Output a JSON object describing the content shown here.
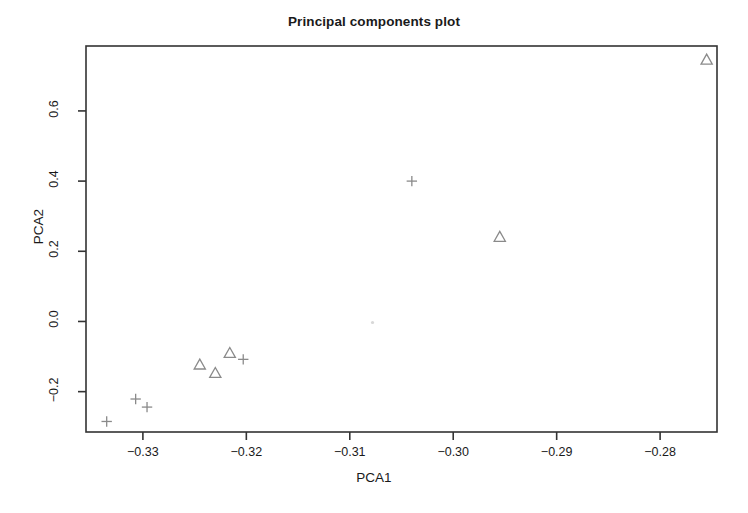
{
  "chart_data": {
    "type": "scatter",
    "title": "Principal components plot",
    "xlabel": "PCA1",
    "ylabel": "PCA2",
    "xlim": [
      -0.3355,
      -0.2745
    ],
    "ylim": [
      -0.315,
      0.785
    ],
    "grid": false,
    "legend": null,
    "xticks": [
      -0.33,
      -0.32,
      -0.31,
      -0.3,
      -0.29,
      -0.28
    ],
    "xtick_labels": [
      "−0.33",
      "−0.32",
      "−0.31",
      "−0.30",
      "−0.29",
      "−0.28"
    ],
    "yticks": [
      -0.2,
      0.0,
      0.2,
      0.4,
      0.6
    ],
    "ytick_labels": [
      "−0.2",
      "0.0",
      "0.2",
      "0.4",
      "0.6"
    ],
    "marker_color": "#8a8a8a",
    "frame_color": "#333333",
    "series": [
      {
        "name": "plus-group",
        "marker": "plus",
        "points": [
          {
            "x": -0.3335,
            "y": -0.285
          },
          {
            "x": -0.3307,
            "y": -0.221
          },
          {
            "x": -0.3296,
            "y": -0.244
          },
          {
            "x": -0.3203,
            "y": -0.108
          },
          {
            "x": -0.304,
            "y": 0.4
          }
        ]
      },
      {
        "name": "triangle-group",
        "marker": "triangle",
        "points": [
          {
            "x": -0.3245,
            "y": -0.124
          },
          {
            "x": -0.323,
            "y": -0.148
          },
          {
            "x": -0.3216,
            "y": -0.091
          },
          {
            "x": -0.2955,
            "y": 0.24
          },
          {
            "x": -0.2755,
            "y": 0.745
          }
        ]
      },
      {
        "name": "faint-point",
        "marker": "dot",
        "points": [
          {
            "x": -0.3078,
            "y": -0.003
          }
        ]
      }
    ]
  }
}
